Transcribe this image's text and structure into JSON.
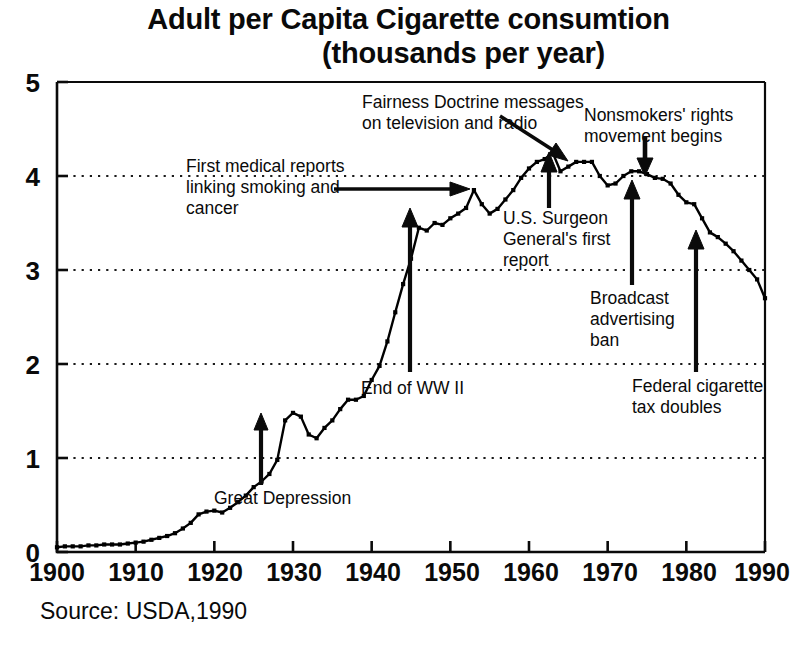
{
  "title": {
    "line1": "Adult per Capita Cigarette consumtion",
    "line2": "(thousands per year)"
  },
  "source": "Source: USDA,1990",
  "axes": {
    "y_ticks": [
      "0",
      "1",
      "2",
      "3",
      "4",
      "5"
    ],
    "x_ticks": [
      "1900",
      "1910",
      "1920",
      "1930",
      "1940",
      "1950",
      "1960",
      "1970",
      "1980",
      "1990"
    ]
  },
  "annotations": [
    {
      "id": "first-medical-reports",
      "text": "First medical reports\nlinking smoking and\ncancer"
    },
    {
      "id": "fairness-doctrine",
      "text": "Fairness Doctrine messages\non television and radio"
    },
    {
      "id": "nonsmokers-rights",
      "text": "Nonsmokers' rights\nmovement begins"
    },
    {
      "id": "surgeon-general",
      "text": "U.S. Surgeon\nGeneral's first\nreport"
    },
    {
      "id": "broadcast-ad-ban",
      "text": "Broadcast\nadvertising\nban"
    },
    {
      "id": "federal-tax-doubles",
      "text": "Federal cigarette\ntax doubles"
    },
    {
      "id": "end-of-ww2",
      "text": "End of WW II"
    },
    {
      "id": "great-depression",
      "text": "Great Depression"
    }
  ],
  "chart_data": {
    "type": "line",
    "title": "Adult per Capita Cigarette consumtion (thousands per year)",
    "xlabel": "",
    "ylabel": "thousands per year",
    "xlim": [
      1900,
      1990
    ],
    "ylim": [
      0,
      5
    ],
    "grid": "horizontal dotted at y = 1, 2, 3, 4",
    "legend": "none",
    "markers": "small filled squares at each yearly point",
    "x": [
      1900,
      1901,
      1902,
      1903,
      1904,
      1905,
      1906,
      1907,
      1908,
      1909,
      1910,
      1911,
      1912,
      1913,
      1914,
      1915,
      1916,
      1917,
      1918,
      1919,
      1920,
      1921,
      1922,
      1923,
      1924,
      1925,
      1926,
      1927,
      1928,
      1929,
      1930,
      1931,
      1932,
      1933,
      1934,
      1935,
      1936,
      1937,
      1938,
      1939,
      1940,
      1941,
      1942,
      1943,
      1944,
      1945,
      1946,
      1947,
      1948,
      1949,
      1950,
      1951,
      1952,
      1953,
      1954,
      1955,
      1956,
      1957,
      1958,
      1959,
      1960,
      1961,
      1962,
      1963,
      1964,
      1965,
      1966,
      1967,
      1968,
      1969,
      1970,
      1971,
      1972,
      1973,
      1974,
      1975,
      1976,
      1977,
      1978,
      1979,
      1980,
      1981,
      1982,
      1983,
      1984,
      1985,
      1986,
      1987,
      1988,
      1989,
      1990
    ],
    "values": [
      0.05,
      0.06,
      0.06,
      0.06,
      0.07,
      0.07,
      0.08,
      0.08,
      0.08,
      0.09,
      0.1,
      0.11,
      0.13,
      0.15,
      0.17,
      0.2,
      0.25,
      0.31,
      0.4,
      0.43,
      0.44,
      0.42,
      0.47,
      0.53,
      0.6,
      0.69,
      0.75,
      0.83,
      0.98,
      1.4,
      1.48,
      1.44,
      1.25,
      1.21,
      1.32,
      1.4,
      1.52,
      1.62,
      1.62,
      1.66,
      1.83,
      1.98,
      2.24,
      2.55,
      2.85,
      3.12,
      3.45,
      3.42,
      3.5,
      3.48,
      3.55,
      3.6,
      3.66,
      3.85,
      3.7,
      3.6,
      3.65,
      3.75,
      3.85,
      3.98,
      4.08,
      4.15,
      4.18,
      4.25,
      4.05,
      4.1,
      4.15,
      4.15,
      4.15,
      4.0,
      3.9,
      3.92,
      4.0,
      4.05,
      4.05,
      4.02,
      3.98,
      3.97,
      3.92,
      3.8,
      3.72,
      3.7,
      3.55,
      3.4,
      3.35,
      3.28,
      3.2,
      3.1,
      3.0,
      2.9,
      2.7
    ],
    "annotated_events": [
      {
        "label": "Great Depression",
        "year": 1929,
        "value_at_year": 1.4
      },
      {
        "label": "End of WW II",
        "year": 1945,
        "value_at_year": 3.12
      },
      {
        "label": "First medical reports linking smoking and cancer",
        "year": 1953,
        "value_at_year": 3.85
      },
      {
        "label": "U.S. Surgeon General's first report",
        "year": 1964,
        "value_at_year": 4.05
      },
      {
        "label": "Fairness Doctrine messages on television and radio",
        "year": 1967,
        "value_at_year": 4.15
      },
      {
        "label": "Broadcast advertising ban",
        "year": 1971,
        "value_at_year": 3.92
      },
      {
        "label": "Nonsmokers' rights movement begins",
        "year": 1976,
        "value_at_year": 4.02
      },
      {
        "label": "Federal cigarette tax doubles",
        "year": 1983,
        "value_at_year": 3.4
      }
    ]
  },
  "colors": {
    "line": "#000000",
    "grid": "#222222",
    "background": "#ffffff",
    "text": "#0a0a0a"
  }
}
